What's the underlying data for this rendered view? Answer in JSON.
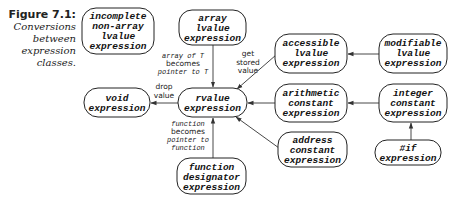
{
  "caption": {
    "figure": "Figure 7.1:",
    "lines": [
      "Conversions",
      "between",
      "expression",
      "classes."
    ]
  },
  "nodes": {
    "incomplete": [
      "incomplete",
      "non-array",
      "lvalue",
      "expression"
    ],
    "array": [
      "array",
      "lvalue",
      "expression"
    ],
    "accessible": [
      "accessible",
      "lvalue",
      "expression"
    ],
    "modifiable": [
      "modifiable",
      "lvalue",
      "expression"
    ],
    "void": [
      "void",
      "expression"
    ],
    "rvalue": [
      "rvalue",
      "expression"
    ],
    "arithmetic": [
      "arithmetic",
      "constant",
      "expression"
    ],
    "integer": [
      "integer",
      "constant",
      "expression"
    ],
    "address": [
      "address",
      "constant",
      "expression"
    ],
    "ifexpr": [
      "#if",
      "expression"
    ],
    "function": [
      "function",
      "designator",
      "expression"
    ]
  },
  "edge_labels": {
    "array_to_rvalue": [
      {
        "text": "array of T",
        "style": "mono"
      },
      {
        "text": "becomes",
        "style": "sans"
      },
      {
        "text": "pointer to T",
        "style": "mono"
      }
    ],
    "accessible_to_rvalue": [
      {
        "text": "get",
        "style": "sans"
      },
      {
        "text": "stored",
        "style": "sans"
      },
      {
        "text": "value",
        "style": "sans"
      }
    ],
    "rvalue_to_void": [
      {
        "text": "drop",
        "style": "sans"
      },
      {
        "text": "value",
        "style": "sans"
      }
    ],
    "function_to_rvalue": [
      {
        "text": "function",
        "style": "mono"
      },
      {
        "text": "becomes",
        "style": "sans"
      },
      {
        "text": "pointer to",
        "style": "mono"
      },
      {
        "text": "function",
        "style": "mono"
      }
    ]
  }
}
